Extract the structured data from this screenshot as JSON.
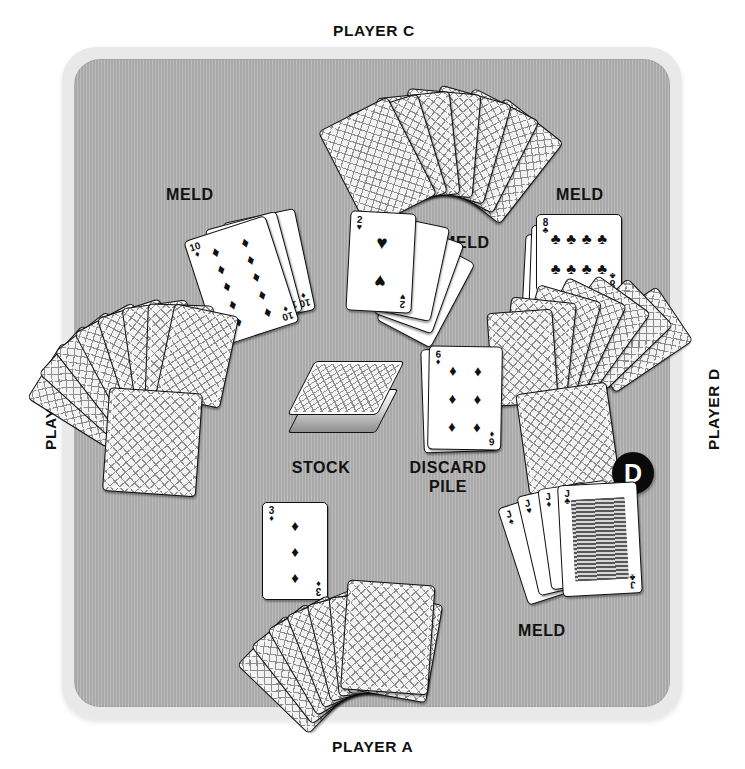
{
  "diagram": {
    "title_alt": "Card game table layout",
    "table_color": "#a9a9a9",
    "table_border_color": "#e9e9e9",
    "accent_color": "#0a0a0a"
  },
  "players": {
    "top": "PLAYER C",
    "bottom": "PLAYER A",
    "left": "PLAYER B",
    "right": "PLAYER D"
  },
  "piles": {
    "stock_label": "STOCK",
    "discard_label_line1": "DISCARD",
    "discard_label_line2": "PILE"
  },
  "melds": {
    "left_label": "MELD",
    "center_label": "MELD",
    "right_label": "MELD",
    "bottom_right_label": "MELD"
  },
  "dealer_button": {
    "label": "D",
    "belongs_to": "PLAYER D"
  },
  "cards": {
    "meld_left": {
      "rank": "10",
      "suit": "♦",
      "suit_name": "diamonds",
      "count": 3
    },
    "meld_center": {
      "rank": "2",
      "suit": "♥",
      "suit_name": "hearts",
      "count": 4
    },
    "meld_right": {
      "rank": "8",
      "suit": "♣",
      "suit_name": "clubs",
      "count": 3
    },
    "meld_bottom_right": {
      "rank": "J",
      "suit": "♣",
      "suit_name": "clubs",
      "count": 4
    },
    "discard_top": {
      "rank": "6",
      "suit": "♦",
      "suit_name": "diamonds"
    },
    "table_card": {
      "rank": "3",
      "suit": "♦",
      "suit_name": "diamonds"
    },
    "hand_a_count": 9,
    "hand_b_count": 9,
    "hand_c_count": 7,
    "hand_d_count": 8
  }
}
